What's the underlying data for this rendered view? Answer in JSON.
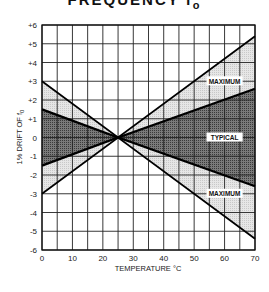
{
  "header": {
    "title": "FREQUENCY f",
    "title_sub": "o"
  },
  "chart_data": {
    "type": "area",
    "xlabel": "TEMPERATURE °C",
    "ylabel": "% DRIFT OF f0",
    "xlim": [
      0,
      70
    ],
    "ylim": [
      -6,
      6
    ],
    "x_ticks": [
      0,
      10,
      20,
      30,
      40,
      50,
      60,
      70
    ],
    "x_tick_labels": [
      "0",
      "10",
      "20",
      "30",
      "40",
      "50",
      "60",
      "70"
    ],
    "y_ticks": [
      6,
      5,
      4,
      3,
      2,
      1,
      0,
      -1,
      -2,
      -3,
      -4,
      -5,
      -6
    ],
    "y_tick_labels": [
      "+6",
      "+5",
      "+4",
      "+3",
      "+2",
      "+1",
      "0",
      "-1",
      "-2",
      "-3",
      "-4",
      "-5",
      "-6"
    ],
    "grid": true,
    "grid_x_step": 5,
    "grid_y_step": 1,
    "legend": null,
    "series": [
      {
        "name": "MAXIMUM (upper)",
        "x": [
          0,
          25,
          70
        ],
        "values": [
          3.0,
          0,
          5.4
        ]
      },
      {
        "name": "TYPICAL (upper)",
        "x": [
          0,
          25,
          70
        ],
        "values": [
          1.5,
          0,
          2.6
        ]
      },
      {
        "name": "TYPICAL (lower)",
        "x": [
          0,
          25,
          70
        ],
        "values": [
          -1.5,
          0,
          -2.6
        ]
      },
      {
        "name": "MAXIMUM (lower)",
        "x": [
          0,
          25,
          70
        ],
        "values": [
          -3.0,
          0,
          -5.4
        ]
      }
    ],
    "annotations": [
      {
        "text": "MAXIMUM",
        "x": 60,
        "y": 3.0
      },
      {
        "text": "TYPICAL",
        "x": 60,
        "y": 0
      },
      {
        "text": "MAXIMUM",
        "x": 60,
        "y": -3.0
      }
    ],
    "crossover_point": {
      "x": 25,
      "y": 0
    }
  },
  "labels": {
    "max_upper": "MAXIMUM",
    "typical": "TYPICAL",
    "max_lower": "MAXIMUM",
    "xlabel": "TEMPERATURE °C",
    "ylabel": "1% DRIFT OF f",
    "ylabel_sub": "0"
  }
}
